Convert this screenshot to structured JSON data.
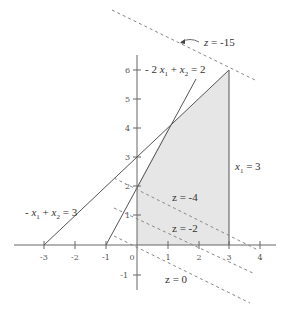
{
  "diagram": {
    "type": "linear-programming-feasible-region",
    "colors": {
      "axis": "#666666",
      "line": "#555555",
      "region_fill": "#e6e6e6",
      "dashed": "#888888",
      "text": "#333333"
    },
    "axes": {
      "x_ticks": [
        "-3",
        "-2",
        "-1",
        "0",
        "1",
        "2",
        "3",
        "4"
      ],
      "y_ticks": [
        "-1",
        "1",
        "2",
        "3",
        "4",
        "5",
        "6"
      ]
    },
    "constraints": [
      {
        "label_prefix": "- 2 ",
        "var1": "x",
        "sub1": "1",
        "op": " + ",
        "var2": "x",
        "sub2": "2",
        "rhs": " = 2"
      },
      {
        "label_prefix": "- ",
        "var1": "x",
        "sub1": "1",
        "op": " + ",
        "var2": "x",
        "sub2": "2",
        "rhs": " = 3"
      },
      {
        "var1": "x",
        "sub1": "1",
        "rhs": " = 3"
      }
    ],
    "objective_lines": [
      {
        "label": "z = -15"
      },
      {
        "label": "z = -4"
      },
      {
        "label": "z = -2"
      },
      {
        "label": "z = 0"
      }
    ],
    "feasible_region_vertices": [
      [
        0,
        0
      ],
      [
        0,
        2
      ],
      [
        1,
        4
      ],
      [
        3,
        6
      ],
      [
        3,
        0
      ]
    ]
  }
}
